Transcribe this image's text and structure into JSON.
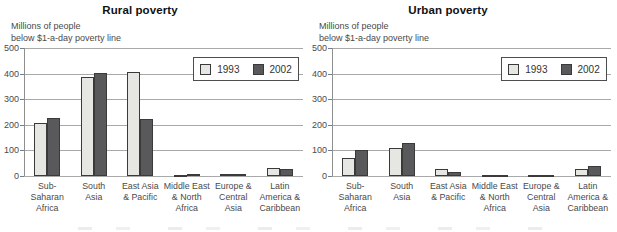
{
  "colors": {
    "series_1993_fill": "#e6e6e3",
    "series_2002_fill": "#59595b",
    "bar_border": "#3a3a3a",
    "gridline": "#a9a9a9",
    "text": "#4a4a4a",
    "title_text": "#111111",
    "background": "#ffffff"
  },
  "chart_data": [
    {
      "type": "bar",
      "title": "Rural poverty",
      "ylabel_lines": [
        "Millions of people",
        "below $1-a-day poverty line"
      ],
      "ylim": [
        0,
        500
      ],
      "yticks": [
        0,
        100,
        200,
        300,
        400,
        500
      ],
      "grid": true,
      "legend_position": "top-right-inside",
      "categories": [
        "Sub-Saharan Africa",
        "South Asia",
        "East Asia & Pacific",
        "Middle East & North Africa",
        "Europe & Central Asia",
        "Latin America & Caribbean"
      ],
      "category_lines": [
        [
          "Sub-",
          "Saharan",
          "Africa"
        ],
        [
          "South",
          "Asia"
        ],
        [
          "East Asia",
          "& Pacific"
        ],
        [
          "Middle East",
          "& North",
          "Africa"
        ],
        [
          "Europe &",
          "Central",
          "Asia"
        ],
        [
          "Latin",
          "America &",
          "Caribbean"
        ]
      ],
      "series": [
        {
          "name": "1993",
          "values": [
            208,
            385,
            405,
            5,
            6,
            32
          ]
        },
        {
          "name": "2002",
          "values": [
            227,
            403,
            222,
            9,
            7,
            28
          ]
        }
      ]
    },
    {
      "type": "bar",
      "title": "Urban poverty",
      "ylabel_lines": [
        "Millions of people",
        "below $1-a-day poverty line"
      ],
      "ylim": [
        0,
        500
      ],
      "yticks": [
        0,
        100,
        200,
        300,
        400,
        500
      ],
      "grid": true,
      "legend_position": "top-right-inside",
      "categories": [
        "Sub-Saharan Africa",
        "South Asia",
        "East Asia & Pacific",
        "Middle East & North Africa",
        "Europe & Central Asia",
        "Latin America & Caribbean"
      ],
      "category_lines": [
        [
          "Sub-",
          "Saharan",
          "Africa"
        ],
        [
          "South",
          "Asia"
        ],
        [
          "East Asia",
          "& Pacific"
        ],
        [
          "Middle East",
          "& North",
          "Africa"
        ],
        [
          "Europe &",
          "Central",
          "Asia"
        ],
        [
          "Latin",
          "America &",
          "Caribbean"
        ]
      ],
      "series": [
        {
          "name": "1993",
          "values": [
            69,
            110,
            29,
            3,
            4,
            26
          ]
        },
        {
          "name": "2002",
          "values": [
            102,
            128,
            16,
            4,
            5,
            40
          ]
        }
      ]
    }
  ]
}
